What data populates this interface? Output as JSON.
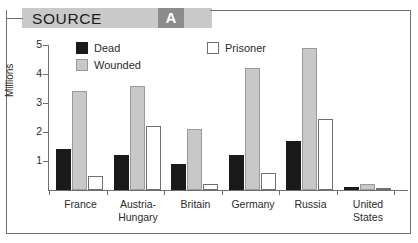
{
  "header": {
    "title": "SOURCE",
    "badge": "A"
  },
  "chart_data": {
    "type": "bar",
    "title": "",
    "xlabel": "",
    "ylabel": "Millions",
    "ylim": [
      0,
      5
    ],
    "yticks": [
      1,
      2,
      3,
      4,
      5
    ],
    "grid": false,
    "legend_position": "top",
    "categories": [
      "France",
      "Austria-Hungary",
      "Britain",
      "Germany",
      "Russia",
      "United States"
    ],
    "category_lines": [
      [
        "France"
      ],
      [
        "Austria-",
        "Hungary"
      ],
      [
        "Britain"
      ],
      [
        "Germany"
      ],
      [
        "Russia"
      ],
      [
        "United",
        "States"
      ]
    ],
    "series": [
      {
        "name": "Dead",
        "color": "#1a1a1a",
        "values": [
          1.4,
          1.2,
          0.9,
          1.2,
          1.7,
          0.12
        ]
      },
      {
        "name": "Wounded",
        "color": "#c8c8c8",
        "values": [
          3.4,
          3.6,
          2.1,
          4.2,
          4.9,
          0.21
        ]
      },
      {
        "name": "Prisoner",
        "color": "#ffffff",
        "values": [
          0.5,
          2.2,
          0.2,
          0.6,
          2.45,
          0.04
        ]
      }
    ]
  }
}
